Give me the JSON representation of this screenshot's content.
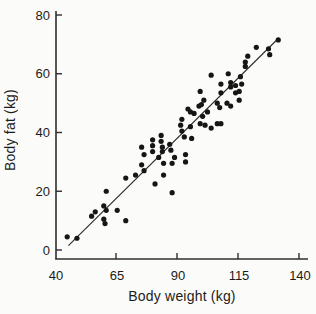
{
  "figure": {
    "background": "#fbfbf9",
    "dot_color": "#161616",
    "axis_color": "#2f2f2f",
    "line_color": "#2a2a2a",
    "text_color": "#1c1c1c"
  },
  "chart_data": {
    "type": "scatter",
    "title": "",
    "xlabel": "Body weight (kg)",
    "ylabel": "Body fat (kg)",
    "xlim": [
      40,
      143
    ],
    "ylim": [
      0,
      80
    ],
    "x_ticks": [
      40,
      65,
      90,
      115,
      140
    ],
    "y_ticks": [
      0,
      20,
      40,
      60,
      80
    ],
    "grid": false,
    "legend": null,
    "regression_line": {
      "x1": 45.5,
      "y1": 1.5,
      "x2": 131.5,
      "y2": 72
    },
    "points": [
      [
        45,
        4.5
      ],
      [
        49,
        4
      ],
      [
        55,
        11.5
      ],
      [
        56.5,
        13
      ],
      [
        60,
        15
      ],
      [
        60,
        10.5
      ],
      [
        60.5,
        9
      ],
      [
        61,
        20
      ],
      [
        61,
        13.5
      ],
      [
        65.5,
        13.5
      ],
      [
        69,
        10
      ],
      [
        69,
        24.5
      ],
      [
        73,
        25.5
      ],
      [
        75.5,
        35
      ],
      [
        75.5,
        29
      ],
      [
        76.5,
        32.5
      ],
      [
        76.5,
        27
      ],
      [
        80,
        37.5
      ],
      [
        80,
        35.5
      ],
      [
        80,
        33.5
      ],
      [
        81,
        22.5
      ],
      [
        82.5,
        31.5
      ],
      [
        83.5,
        39
      ],
      [
        83.5,
        37
      ],
      [
        84,
        35
      ],
      [
        84,
        33.5
      ],
      [
        84.5,
        29.5
      ],
      [
        84.5,
        25.5
      ],
      [
        87,
        36
      ],
      [
        87.5,
        34
      ],
      [
        88,
        29.5
      ],
      [
        88,
        19.5
      ],
      [
        89,
        31.5
      ],
      [
        91.5,
        42.5
      ],
      [
        92,
        44.5
      ],
      [
        92,
        40.5
      ],
      [
        93,
        38.5
      ],
      [
        93.5,
        32.5
      ],
      [
        93.5,
        30
      ],
      [
        94.5,
        48
      ],
      [
        95.5,
        47
      ],
      [
        95.5,
        42
      ],
      [
        96,
        38
      ],
      [
        97,
        46.5
      ],
      [
        99,
        49
      ],
      [
        99.5,
        54
      ],
      [
        99.5,
        43
      ],
      [
        100,
        49.5
      ],
      [
        100.5,
        45.5
      ],
      [
        101,
        51
      ],
      [
        101.5,
        42.5
      ],
      [
        102.5,
        47
      ],
      [
        104,
        59.5
      ],
      [
        104,
        41.5
      ],
      [
        106.5,
        50
      ],
      [
        106.5,
        43
      ],
      [
        107.5,
        48.5
      ],
      [
        108,
        53.5
      ],
      [
        108,
        56.5
      ],
      [
        108,
        43
      ],
      [
        110.5,
        50
      ],
      [
        111,
        60
      ],
      [
        112,
        57
      ],
      [
        112,
        55.5
      ],
      [
        112,
        49
      ],
      [
        114,
        56
      ],
      [
        114,
        53.5
      ],
      [
        115.5,
        54
      ],
      [
        115.5,
        51
      ],
      [
        116,
        59
      ],
      [
        116.5,
        56.5
      ],
      [
        118,
        62.5
      ],
      [
        118,
        64
      ],
      [
        119,
        66
      ],
      [
        122.5,
        69
      ],
      [
        127.5,
        68.5
      ],
      [
        128,
        66.5
      ],
      [
        131.5,
        71.5
      ]
    ]
  }
}
